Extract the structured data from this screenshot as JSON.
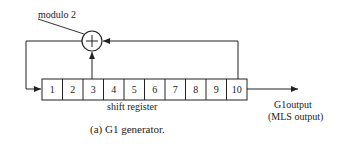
{
  "diagram": {
    "xor_label": "modulo 2",
    "xor_symbol": "+",
    "register_label": "shift register",
    "register_cells": [
      "1",
      "2",
      "3",
      "4",
      "5",
      "6",
      "7",
      "8",
      "9",
      "10"
    ],
    "taps": [
      "3",
      "10"
    ],
    "output_label_line1": "G1output",
    "output_label_line2": "(MLS output)",
    "caption": "(a) G1 generator."
  }
}
